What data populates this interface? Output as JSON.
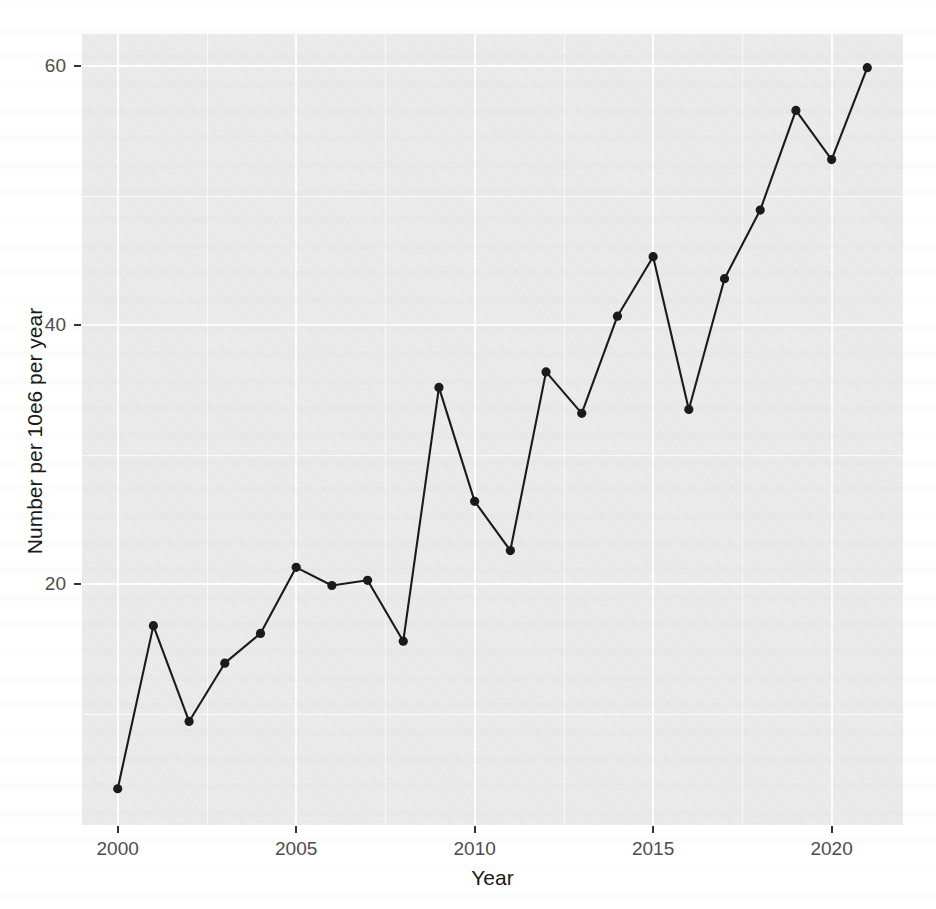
{
  "chart_data": {
    "type": "line",
    "title": "",
    "xlabel": "Year",
    "ylabel": "Number per 10e6 per year",
    "xlim": [
      1999.0,
      2022.0
    ],
    "ylim": [
      1.4,
      62.5
    ],
    "grid": true,
    "legend": "none",
    "x_ticks": [
      2000,
      2005,
      2010,
      2015,
      2020
    ],
    "x_tick_labels": [
      "2000",
      "2005",
      "2010",
      "2015",
      "2020"
    ],
    "y_ticks": [
      20,
      40,
      60
    ],
    "y_tick_labels": [
      "20",
      "40",
      "60"
    ],
    "y_minor_ticks": [
      10,
      30,
      50
    ],
    "x_minor_ticks": [
      2002.5,
      2007.5,
      2012.5,
      2017.5
    ],
    "marker": "circle",
    "marker_color": "#1a1a1a",
    "line_color": "#1a1a1a",
    "panel_background": "#ebebeb",
    "gridline_color": "#ffffff",
    "x": [
      2000,
      2001,
      2002,
      2003,
      2004,
      2005,
      2006,
      2007,
      2008,
      2009,
      2010,
      2011,
      2012,
      2013,
      2014,
      2015,
      2016,
      2017,
      2018,
      2019,
      2020,
      2021
    ],
    "values": [
      4.2,
      16.8,
      9.4,
      13.9,
      16.2,
      21.3,
      19.9,
      20.3,
      15.6,
      35.2,
      26.4,
      22.6,
      36.4,
      33.2,
      40.7,
      45.3,
      33.5,
      43.6,
      48.9,
      56.6,
      52.8,
      59.9
    ],
    "series": [
      {
        "name": "Number per 10e6 per year",
        "values": [
          4.2,
          16.8,
          9.4,
          13.9,
          16.2,
          21.3,
          19.9,
          20.3,
          15.6,
          35.2,
          26.4,
          22.6,
          36.4,
          33.2,
          40.7,
          45.3,
          33.5,
          43.6,
          48.9,
          56.6,
          52.8,
          59.9
        ]
      }
    ]
  }
}
